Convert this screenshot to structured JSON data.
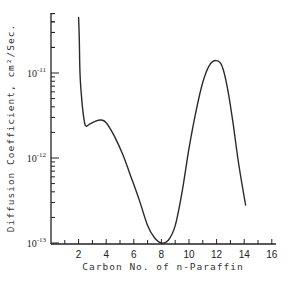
{
  "chart_data": {
    "type": "line",
    "title": "",
    "xlabel": "Carbon No. of n-Paraffin",
    "ylabel": "Diffusion Coefficient, cm²/Sec.",
    "xlim": [
      0,
      16
    ],
    "ylim": [
      1e-13,
      5e-11
    ],
    "yscale": "log",
    "grid": false,
    "legend": null,
    "x_ticks": [
      2,
      4,
      6,
      8,
      10,
      12,
      14,
      16
    ],
    "x_tick_labels": [
      "2",
      "4",
      "6",
      "8",
      "10",
      "12",
      "14",
      "16"
    ],
    "y_ticks": [
      1e-11,
      1e-12,
      1e-13
    ],
    "y_tick_labels": [
      {
        "base": "10",
        "exp": "-11"
      },
      {
        "base": "10",
        "exp": "-12"
      },
      {
        "base": "10",
        "exp": "-13"
      }
    ],
    "series": [
      {
        "name": "Diffusion coefficient",
        "x": [
          2.0,
          2.05,
          2.1,
          2.2,
          2.35,
          2.5,
          2.8,
          3.2,
          3.6,
          4.0,
          4.6,
          5.2,
          5.8,
          6.4,
          7.0,
          7.5,
          8.0,
          8.5,
          9.0,
          9.5,
          10.0,
          10.5,
          11.0,
          11.5,
          12.0,
          12.4,
          12.8,
          13.2,
          13.6,
          14.1
        ],
        "y": [
          4.5e-11,
          2.5e-11,
          1e-11,
          5.5e-12,
          3.2e-12,
          2.4e-12,
          2.5e-12,
          2.7e-12,
          2.8e-12,
          2.6e-12,
          1.8e-12,
          1.1e-12,
          6e-13,
          3.2e-13,
          1.6e-13,
          1.15e-13,
          1e-13,
          1.08e-13,
          1.6e-13,
          4e-13,
          1.3e-12,
          3.5e-12,
          7.8e-12,
          1.25e-11,
          1.4e-11,
          1.2e-11,
          6.5e-12,
          2.5e-12,
          8.5e-13,
          2.8e-13
        ]
      }
    ]
  }
}
